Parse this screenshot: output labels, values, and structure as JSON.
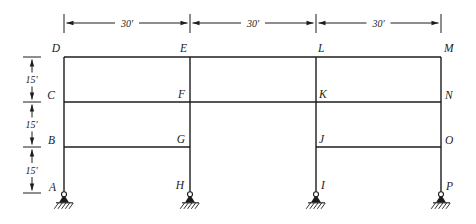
{
  "diagram": {
    "background_color": "#ffffff",
    "line_color": "#1c1c1c",
    "nodes": [
      {
        "id": "D"
      },
      {
        "id": "E"
      },
      {
        "id": "L"
      },
      {
        "id": "M"
      },
      {
        "id": "C"
      },
      {
        "id": "F"
      },
      {
        "id": "K"
      },
      {
        "id": "N"
      },
      {
        "id": "B"
      },
      {
        "id": "G"
      },
      {
        "id": "J"
      },
      {
        "id": "O"
      },
      {
        "id": "A"
      },
      {
        "id": "H"
      },
      {
        "id": "I"
      },
      {
        "id": "P"
      }
    ],
    "span_dimensions": [
      {
        "label": "30′"
      },
      {
        "label": "30′"
      },
      {
        "label": "30′"
      }
    ],
    "height_dimensions": [
      {
        "label": "15′"
      },
      {
        "label": "15′"
      },
      {
        "label": "15′"
      }
    ],
    "supports": [
      {
        "type": "pin",
        "at_node": "A"
      },
      {
        "type": "pin",
        "at_node": "H"
      },
      {
        "type": "pin",
        "at_node": "I"
      },
      {
        "type": "pin",
        "at_node": "P"
      }
    ]
  }
}
